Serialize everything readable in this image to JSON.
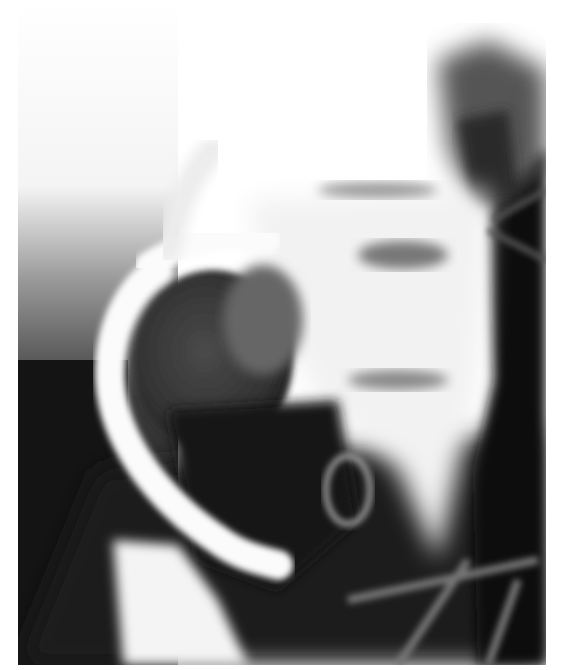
{
  "image": {
    "type": "radiograph",
    "description": "Contrast X-ray of abdomen showing bright barium-filled bowel loop curving around a dark rounded mass",
    "colors": {
      "background": "#ffffff",
      "contrast_white": "#f8f8f8",
      "soft_tissue_gray": "#6a6a6a",
      "dark_region": "#141414"
    },
    "frame": {
      "x": 18,
      "y": 0,
      "width": 528,
      "height": 665
    }
  }
}
